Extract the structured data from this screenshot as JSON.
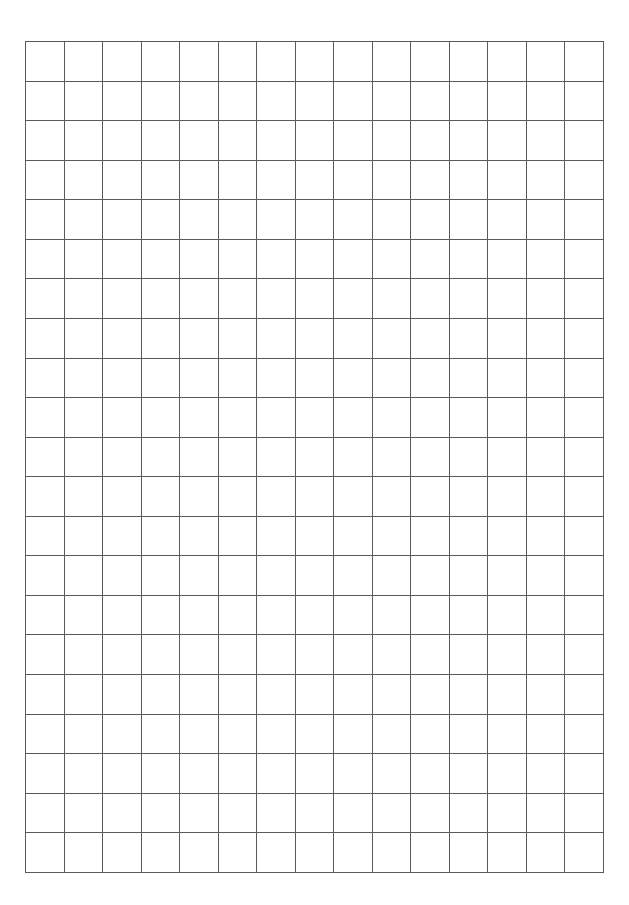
{
  "document": {
    "title": "Blank Square Grid Sheet",
    "kind": "graph-paper",
    "background_color": "#ffffff",
    "page_width_px": 629,
    "page_height_px": 905
  },
  "grid": {
    "columns": 15,
    "rows": 21,
    "origin_x_px": 25,
    "origin_y_px": 41,
    "right_edge_px": 604,
    "bottom_edge_px": 872,
    "cell_width_px": 38.6,
    "cell_height_px": 39.57,
    "line_color": "#5a5a5a",
    "line_color_light": "#8a8a8a",
    "line_width_px": 1,
    "outer_line_width_px": 1,
    "cell_fill_color": "#ffffff",
    "margins": {
      "left_px": 25,
      "top_px": 41,
      "right_px": 25,
      "bottom_px": 33
    }
  },
  "annotations": {
    "text_content": "",
    "labels": [],
    "marks": []
  },
  "chart_data": {
    "type": "table",
    "title": "",
    "xlabel": "",
    "ylabel": "",
    "columns": 15,
    "rows": 21,
    "cells": [],
    "grid": true,
    "legend": "none"
  }
}
